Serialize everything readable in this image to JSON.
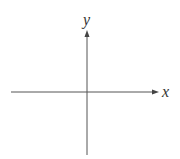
{
  "diagram": {
    "type": "cartesian-axes",
    "x_axis": {
      "label": "x",
      "color": "#555555"
    },
    "y_axis": {
      "label": "y",
      "color": "#555555"
    }
  }
}
